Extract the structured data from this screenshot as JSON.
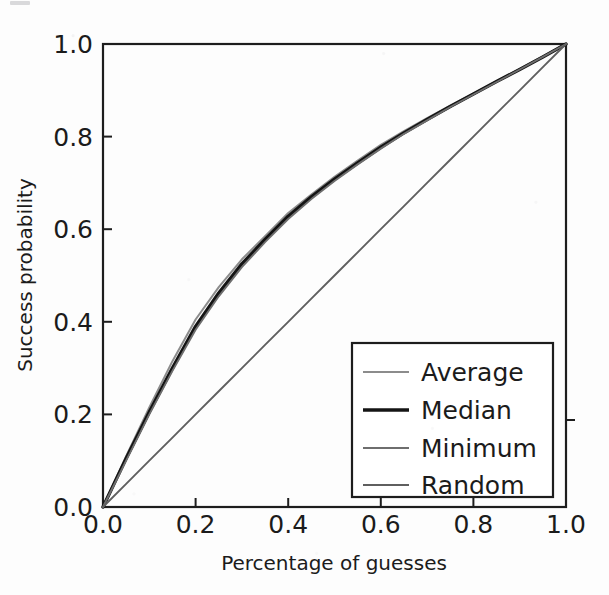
{
  "chart_data": {
    "type": "line",
    "title": "",
    "xlabel": "Percentage of guesses",
    "ylabel": "Success probability",
    "xlim": [
      0.0,
      1.0
    ],
    "ylim": [
      0.0,
      1.0
    ],
    "xticks": [
      "0.0",
      "0.2",
      "0.4",
      "0.6",
      "0.8",
      "1.0"
    ],
    "yticks": [
      "0.0",
      "0.2",
      "0.4",
      "0.6",
      "0.8",
      "1.0"
    ],
    "xtick_values": [
      0.0,
      0.2,
      0.4,
      0.6,
      0.8,
      1.0
    ],
    "ytick_values": [
      0.0,
      0.2,
      0.4,
      0.6,
      0.8,
      1.0
    ],
    "grid": false,
    "legend_position": "lower right",
    "x": [
      0.0,
      0.05,
      0.1,
      0.15,
      0.2,
      0.25,
      0.3,
      0.35,
      0.4,
      0.45,
      0.5,
      0.55,
      0.6,
      0.65,
      0.7,
      0.75,
      0.8,
      0.85,
      0.9,
      0.95,
      1.0
    ],
    "series": [
      {
        "name": "Average",
        "color": "#8c8c8c",
        "width": 2.0,
        "values": [
          0.0,
          0.11,
          0.215,
          0.315,
          0.405,
          0.475,
          0.535,
          0.585,
          0.635,
          0.675,
          0.713,
          0.748,
          0.782,
          0.812,
          0.84,
          0.867,
          0.893,
          0.92,
          0.946,
          0.973,
          1.0
        ]
      },
      {
        "name": "Median",
        "color": "#141414",
        "width": 3.4,
        "values": [
          0.0,
          0.105,
          0.205,
          0.3,
          0.39,
          0.462,
          0.525,
          0.578,
          0.628,
          0.67,
          0.708,
          0.743,
          0.777,
          0.808,
          0.837,
          0.865,
          0.892,
          0.919,
          0.945,
          0.972,
          1.0
        ]
      },
      {
        "name": "Minimum",
        "color": "#6e6e6e",
        "width": 1.9,
        "values": [
          0.0,
          0.1,
          0.2,
          0.294,
          0.383,
          0.455,
          0.518,
          0.572,
          0.622,
          0.665,
          0.704,
          0.74,
          0.774,
          0.806,
          0.835,
          0.864,
          0.891,
          0.918,
          0.945,
          0.972,
          1.0
        ]
      },
      {
        "name": "Random",
        "color": "#5f5f5f",
        "width": 1.9,
        "values": [
          0.0,
          0.05,
          0.1,
          0.15,
          0.2,
          0.25,
          0.3,
          0.35,
          0.4,
          0.45,
          0.5,
          0.55,
          0.6,
          0.65,
          0.7,
          0.75,
          0.8,
          0.85,
          0.9,
          0.95,
          1.0
        ]
      }
    ]
  },
  "figure": {
    "background_color": "#fdfdfd",
    "axis_color": "#1d1d1d",
    "text_color": "#1b1b1b"
  }
}
